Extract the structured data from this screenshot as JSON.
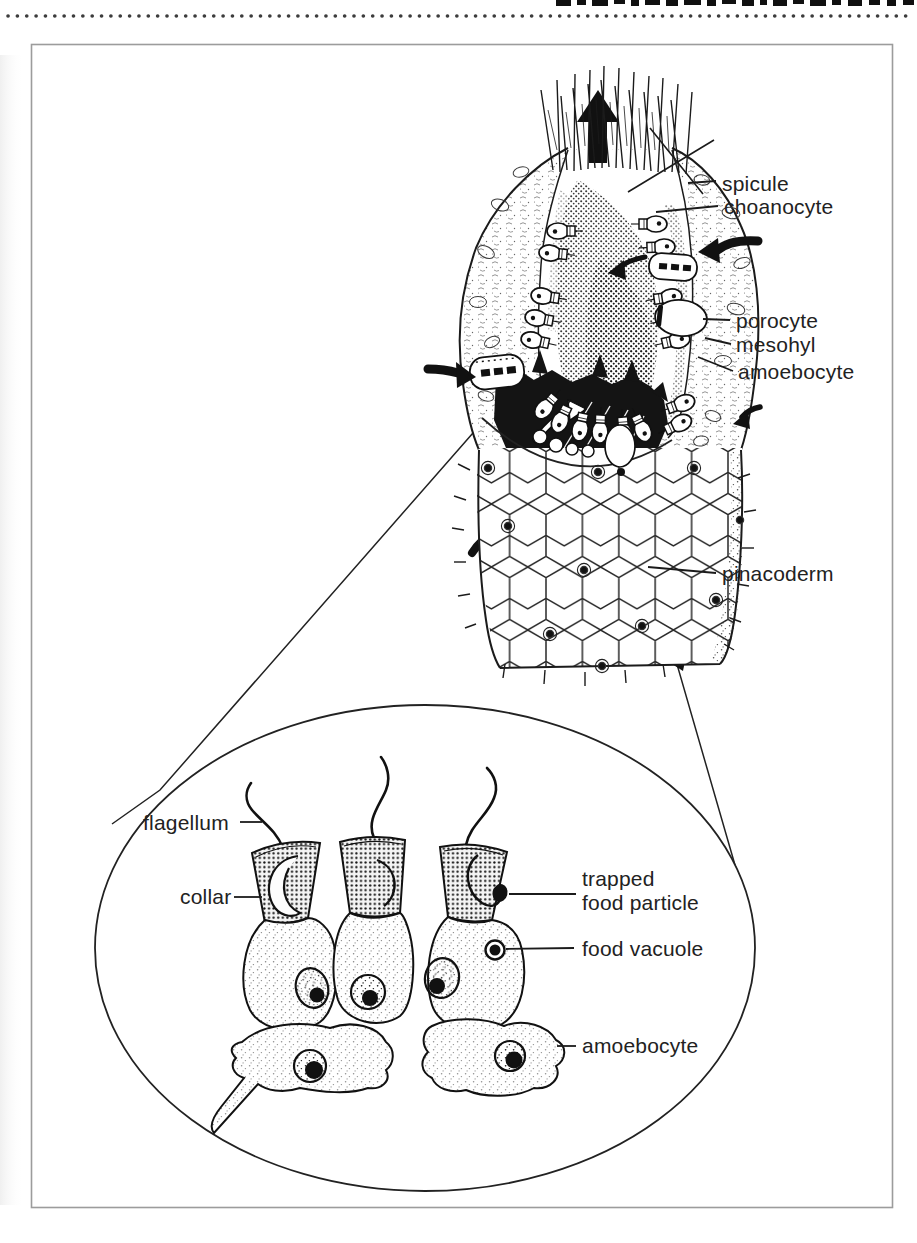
{
  "page": {
    "background": "#ffffff",
    "ink_color": "#1b1b1b",
    "frame_border_color": "#9c9c9c",
    "masthead_clipped_text": true
  },
  "diagram": {
    "sponge_labels": {
      "spicule": "spicule",
      "choanocyte": "choanocyte",
      "porocyte": "porocyte",
      "mesohyl": "mesohyl",
      "amoebocyte": "amoebocyte",
      "pinacoderm": "pinacoderm"
    },
    "inset_labels": {
      "flagellum": "flagellum",
      "collar": "collar",
      "trapped_line1": "trapped",
      "trapped_line2": "food particle",
      "food_vacuole": "food vacuole",
      "amoebocyte": "amoebocyte"
    }
  }
}
